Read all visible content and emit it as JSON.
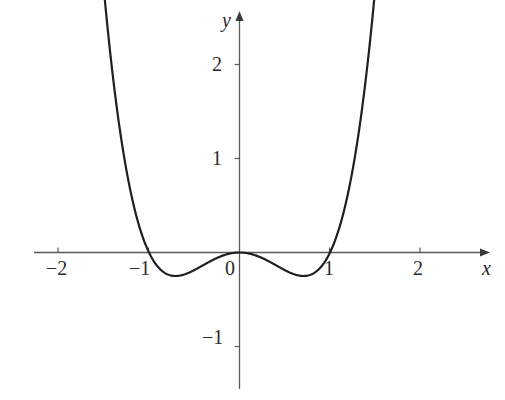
{
  "figure": {
    "background_color": "#ffffff",
    "curve_color": "#1f1f1f",
    "axis_color": "#5a5a5a",
    "text_color": "#2a2a2a"
  },
  "axes": {
    "x_name": "x",
    "y_name": "y",
    "origin_label": "0"
  },
  "chart_data": {
    "type": "line",
    "title": "",
    "subtitle": "",
    "xlabel": "x",
    "ylabel": "y",
    "xlim": [
      -2.4,
      2.7
    ],
    "ylim": [
      -1.6,
      2.8
    ],
    "xticks": [
      -2,
      -1,
      0,
      1,
      2
    ],
    "xticklabels": [
      "−2",
      "−1",
      "0",
      "1",
      "2"
    ],
    "yticks": [
      -1,
      1,
      2
    ],
    "yticklabels": [
      "−1",
      "1",
      "2"
    ],
    "grid": false,
    "legend": false,
    "legend_position": "none",
    "axis_style": "arrowed-cartesian-axes",
    "annotations": [],
    "series": [
      {
        "name": "y = x^4 - x^2",
        "expression": "x^4 - x^2",
        "color": "#1f1f1f",
        "linewidth": 2.2,
        "x_start": -1.49,
        "x_end": 1.49,
        "roots": [
          -1,
          0,
          1
        ],
        "local_minima": [
          {
            "x": -0.707,
            "y": -0.25
          },
          {
            "x": 0.707,
            "y": -0.25
          }
        ],
        "local_maxima": [
          {
            "x": 0,
            "y": 0
          }
        ],
        "x": [
          -1.49,
          -1.45,
          -1.4,
          -1.35,
          -1.3,
          -1.25,
          -1.2,
          -1.15,
          -1.1,
          -1.05,
          -1.0,
          -0.95,
          -0.9,
          -0.85,
          -0.8,
          -0.75,
          -0.7,
          -0.65,
          -0.6,
          -0.55,
          -0.5,
          -0.45,
          -0.4,
          -0.35,
          -0.3,
          -0.25,
          -0.2,
          -0.15,
          -0.1,
          -0.05,
          0.0,
          0.05,
          0.1,
          0.15,
          0.2,
          0.25,
          0.3,
          0.35,
          0.4,
          0.45,
          0.5,
          0.55,
          0.6,
          0.65,
          0.7,
          0.75,
          0.8,
          0.85,
          0.9,
          0.95,
          1.0,
          1.05,
          1.1,
          1.15,
          1.2,
          1.25,
          1.3,
          1.35,
          1.4,
          1.45,
          1.49
        ],
        "y": [
          2.71,
          2.31,
          1.88,
          1.5,
          1.17,
          0.88,
          0.63,
          0.43,
          0.25,
          0.11,
          0.0,
          -0.09,
          -0.15,
          -0.2,
          -0.23,
          -0.25,
          -0.25,
          -0.24,
          -0.23,
          -0.21,
          -0.19,
          -0.16,
          -0.13,
          -0.11,
          -0.08,
          -0.06,
          -0.04,
          -0.02,
          -0.01,
          0.0,
          0.0,
          0.0,
          -0.01,
          -0.02,
          -0.04,
          -0.06,
          -0.08,
          -0.11,
          -0.13,
          -0.16,
          -0.19,
          -0.21,
          -0.23,
          -0.24,
          -0.25,
          -0.25,
          -0.23,
          -0.2,
          -0.15,
          -0.09,
          0.0,
          0.11,
          0.25,
          0.43,
          0.63,
          0.88,
          1.17,
          1.5,
          1.88,
          2.31,
          2.71
        ]
      }
    ]
  }
}
